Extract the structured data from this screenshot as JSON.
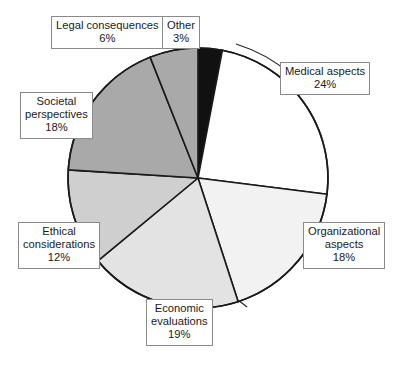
{
  "chart_data": {
    "type": "pie",
    "title": "",
    "subtitle": "",
    "xlabel": "",
    "ylabel": "",
    "legend_position": "none",
    "grid": false,
    "units": "percent",
    "total": 100,
    "start_angle_deg": 0,
    "direction": "clockwise",
    "categories": [
      "Other",
      "Medical aspects",
      "Organizational aspects",
      "Economic evaluations",
      "Ethical considerations",
      "Societal perspectives",
      "Legal consequences"
    ],
    "values": [
      3,
      24,
      18,
      19,
      12,
      18,
      6
    ],
    "slices": [
      {
        "name": "other",
        "label_line1": "Other",
        "label_line2": "",
        "label_line3": "",
        "percent_text": "3%",
        "value": 3,
        "color": "#111111",
        "start_deg": 0,
        "end_deg": 10.8
      },
      {
        "name": "medical-aspects",
        "label_line1": "Medical aspects",
        "label_line2": "",
        "label_line3": "",
        "percent_text": "24%",
        "value": 24,
        "color": "#ffffff",
        "start_deg": 10.8,
        "end_deg": 97.2
      },
      {
        "name": "organizational-aspects",
        "label_line1": "Organizational",
        "label_line2": "aspects",
        "label_line3": "",
        "percent_text": "18%",
        "value": 18,
        "color": "#f2f2f2",
        "start_deg": 97.2,
        "end_deg": 162.0
      },
      {
        "name": "economic-evaluations",
        "label_line1": "Economic",
        "label_line2": "evaluations",
        "label_line3": "",
        "percent_text": "19%",
        "value": 19,
        "color": "#e3e3e3",
        "start_deg": 162.0,
        "end_deg": 230.4
      },
      {
        "name": "ethical-considerations",
        "label_line1": "Ethical",
        "label_line2": "considerations",
        "label_line3": "",
        "percent_text": "12%",
        "value": 12,
        "color": "#cfcfcf",
        "start_deg": 230.4,
        "end_deg": 273.6
      },
      {
        "name": "societal-perspectives",
        "label_line1": "Societal",
        "label_line2": "perspectives",
        "label_line3": "",
        "percent_text": "18%",
        "value": 18,
        "color": "#a9a9a9",
        "start_deg": 273.6,
        "end_deg": 338.4
      },
      {
        "name": "legal-consequences",
        "label_line1": "Legal consequences",
        "label_line2": "",
        "label_line3": "",
        "percent_text": "6%",
        "value": 6,
        "color": "#a9a9a9",
        "start_deg": 338.4,
        "end_deg": 360.0
      }
    ],
    "colors": {
      "outline": "#1a1a1a",
      "background": "#ffffff",
      "label_border": "#8a8a8a",
      "label_text": "#1a1a1a",
      "leader_line": "#2b2b2b"
    }
  }
}
